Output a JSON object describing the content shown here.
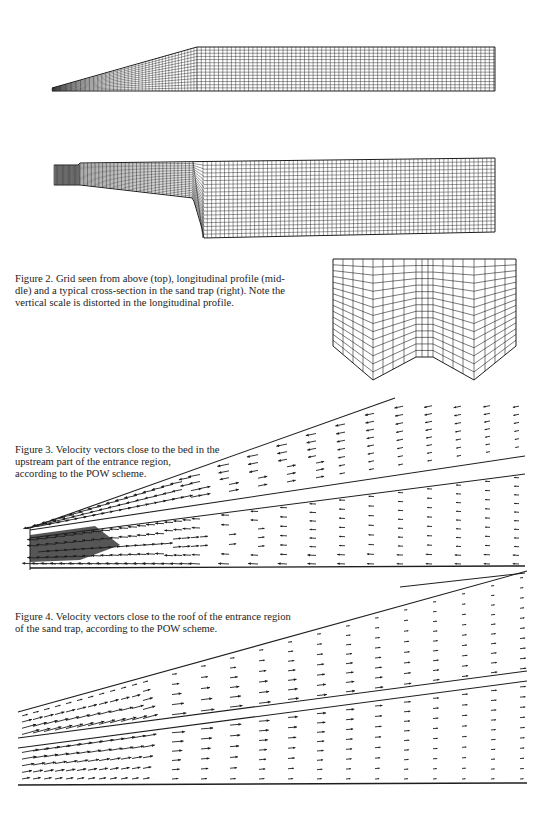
{
  "page": {
    "width": 557,
    "height": 825,
    "background": "#ffffff",
    "ink": "#1a1a1a"
  },
  "figure2": {
    "caption": "Figure 2. Grid seen from above (top), longitudinal profile (middle) and a typical cross-section in the sand trap (right). Note the vertical scale is distorted in the longitudinal profile.",
    "caption_lines": [
      "Figure 2. Grid seen from above (top), longitudinal profile (mid-",
      "dle) and a typical cross-section in the sand trap (right). Note the",
      "vertical scale is distorted in the longitudinal profile."
    ],
    "panels": [
      {
        "name": "grid-top-view",
        "label": "top"
      },
      {
        "name": "grid-longitudinal-profile",
        "label": "middle"
      },
      {
        "name": "grid-cross-section",
        "label": "right"
      }
    ]
  },
  "figure3": {
    "caption_lines": [
      "Figure 3. Velocity vectors close to the bed in the",
      "upstream part of the entrance region,",
      "according to the POW scheme."
    ],
    "scheme": "POW",
    "location": "close to the bed"
  },
  "figure4": {
    "caption_lines": [
      "Figure 4. Velocity vectors close to the roof of the entrance region",
      "of the sand trap, according to the POW scheme."
    ],
    "scheme": "POW",
    "location": "close to the roof"
  }
}
